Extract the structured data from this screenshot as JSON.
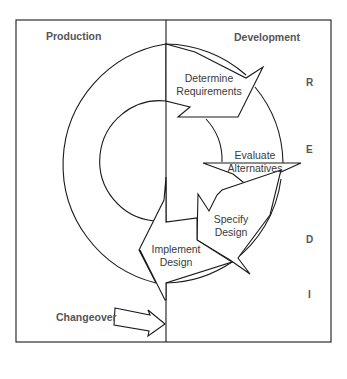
{
  "diagram": {
    "columns": {
      "left": "Production",
      "right": "Development"
    },
    "steps": [
      {
        "line1": "Determine",
        "line2": "Requirements"
      },
      {
        "line1": "Evaluate",
        "line2": "Alternatives"
      },
      {
        "line1": "Specify",
        "line2": "Design"
      },
      {
        "line1": "Implement",
        "line2": "Design"
      }
    ],
    "phases": [
      "R",
      "E",
      "D",
      "I"
    ],
    "changeover": "Changeover",
    "colors": {
      "line": "#1a1a1a",
      "text": "#3a3a3a",
      "header": "#555555",
      "background": "#ffffff"
    }
  }
}
